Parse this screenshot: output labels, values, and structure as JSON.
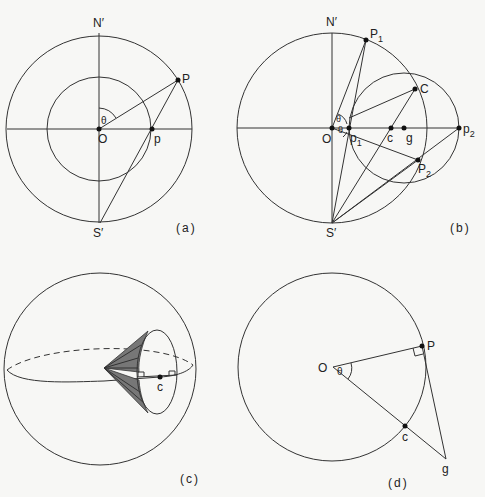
{
  "panels": {
    "a": {
      "caption": "(a)",
      "labels": {
        "N": "N′",
        "S": "S′",
        "O": "O",
        "P": "P",
        "p": "p",
        "theta": "θ"
      }
    },
    "b": {
      "caption": "(b)",
      "labels": {
        "N": "N′",
        "S": "S′",
        "O": "O",
        "P1": "P",
        "P1_sub": "1",
        "P2": "P",
        "P2_sub": "2",
        "C": "C",
        "c": "c",
        "g": "g",
        "p1": "p",
        "p1_sub": "1",
        "p2": "p",
        "p2_sub": "2",
        "theta1": "θ",
        "theta2": "θ"
      }
    },
    "c": {
      "caption": "(c)",
      "labels": {
        "c": "c"
      }
    },
    "d": {
      "caption": "(d)",
      "labels": {
        "O": "O",
        "P": "P",
        "c": "c",
        "g": "g",
        "theta": "θ"
      }
    }
  },
  "colors": {
    "line": "#333333",
    "shade": "#777777",
    "background": "#f7f7f5"
  }
}
